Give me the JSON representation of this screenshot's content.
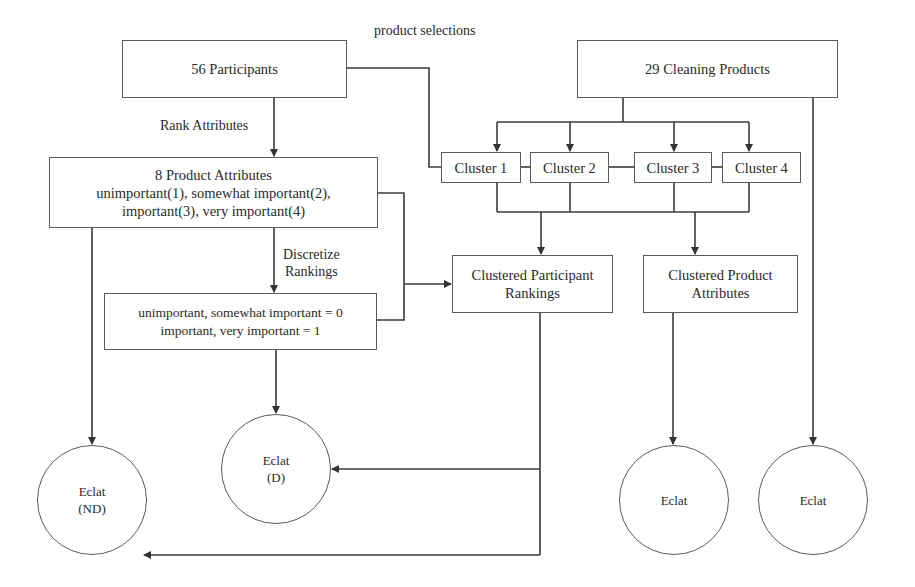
{
  "diagram": {
    "nodes": {
      "participants": "56 Participants",
      "cleaning_products": "29 Cleaning Products",
      "product_attributes": {
        "title": "8 Product Attributes",
        "line2": "unimportant(1), somewhat important(2),",
        "line3": "important(3), very important(4)"
      },
      "discretized": {
        "line1": "unimportant, somewhat important = 0",
        "line2": "important, very important = 1"
      },
      "clusters": [
        "Cluster 1",
        "Cluster 2",
        "Cluster 3",
        "Cluster 4"
      ],
      "clustered_participant_rankings": {
        "line1": "Clustered Participant",
        "line2": "Rankings"
      },
      "clustered_product_attributes": {
        "line1": "Clustered Product",
        "line2": "Attributes"
      },
      "eclat_nd": {
        "line1": "Eclat",
        "line2": "(ND)"
      },
      "eclat_d": {
        "line1": "Eclat",
        "line2": "(D)"
      },
      "eclat_products_clustered": "Eclat",
      "eclat_products": "Eclat"
    },
    "edge_labels": {
      "product_selections": "product selections",
      "rank_attributes": "Rank Attributes",
      "discretize_line1": "Discretize",
      "discretize_line2": "Rankings"
    }
  }
}
